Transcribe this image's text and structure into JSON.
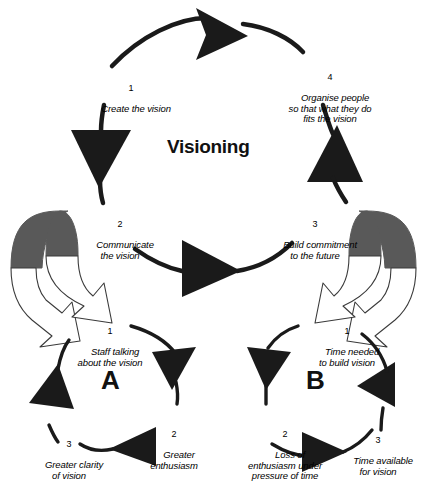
{
  "diagram": {
    "title": "Visioning",
    "colors": {
      "ink": "#111111",
      "arrow_fill": "#1a1a1a",
      "block_arrow_top": "#595959",
      "block_arrow_face": "#ffffff",
      "background": "#ffffff"
    },
    "main_cycle": {
      "name": "Visioning",
      "steps": [
        {
          "number": "1",
          "label": "Create the vision"
        },
        {
          "number": "2",
          "label": "Communicate\nthe vision"
        },
        {
          "number": "3",
          "label": "Build commitment\nto the future"
        },
        {
          "number": "4",
          "label": "Organise people\nso that what they do\nfits the vision"
        }
      ]
    },
    "sub_cycles": [
      {
        "letter": "A",
        "steps": [
          {
            "number": "1",
            "label": "Staff talking\nabout the vision"
          },
          {
            "number": "2",
            "label": "Greater\nenthusiasm"
          },
          {
            "number": "3",
            "label": "Greater clarity\nof vision"
          }
        ]
      },
      {
        "letter": "B",
        "steps": [
          {
            "number": "1",
            "label": "Time needed\nto build vision"
          },
          {
            "number": "2",
            "label": "Loss of\nenthusiasm under\npressure of time"
          },
          {
            "number": "3",
            "label": "Time available\nfor vision"
          }
        ]
      }
    ]
  }
}
